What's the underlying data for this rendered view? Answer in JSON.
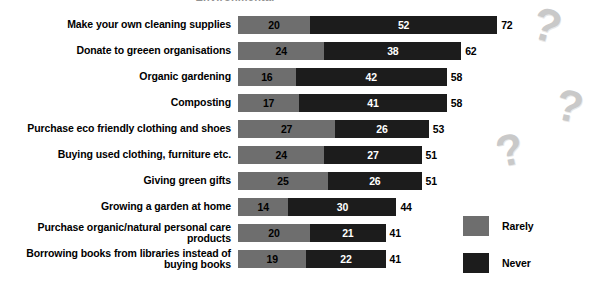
{
  "chart_data": {
    "type": "bar",
    "orientation": "horizontal",
    "stacked": true,
    "title": "Environmental",
    "xlabel": "",
    "ylabel": "",
    "grid": false,
    "legend_position": "right-bottom",
    "categories": [
      "Make your own cleaning supplies",
      "Donate to greeen organisations",
      "Organic gardening",
      "Composting",
      "Purchase eco friendly clothing and shoes",
      "Buying used clothing, furniture etc.",
      "Giving green gifts",
      "Growing a garden at home",
      "Purchase organic/natural personal care products",
      "Borrowing books from libraries instead of buying books"
    ],
    "series": [
      {
        "name": "Rarely",
        "color": "#6e6e6e",
        "values": [
          20,
          24,
          16,
          17,
          27,
          24,
          25,
          14,
          20,
          19
        ]
      },
      {
        "name": "Never",
        "color": "#1c1c1c",
        "values": [
          52,
          38,
          42,
          41,
          26,
          27,
          26,
          30,
          21,
          22
        ]
      }
    ],
    "totals": [
      72,
      62,
      58,
      58,
      53,
      51,
      51,
      44,
      41,
      41
    ],
    "xlim": [
      0,
      72
    ],
    "px_per_unit": 3.6
  },
  "legend": {
    "items": [
      {
        "label": "Rarely",
        "color": "#6e6e6e"
      },
      {
        "label": "Never",
        "color": "#1c1c1c"
      }
    ]
  },
  "decorations": {
    "question_mark": "?"
  }
}
